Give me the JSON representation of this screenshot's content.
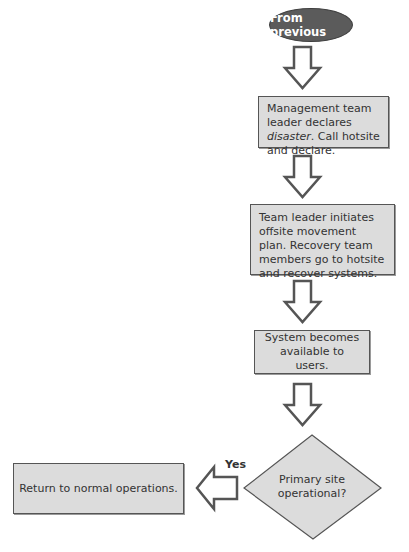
{
  "diagram": {
    "start": {
      "label": "From previous"
    },
    "steps": [
      {
        "id": "box1",
        "text_before": "Management team leader declares ",
        "emphasis": "disaster",
        "text_after": ". Call hotsite and declare."
      },
      {
        "id": "box2",
        "text": "Team leader initiates offsite movement plan. Recovery team members go to hotsite and recover systems."
      },
      {
        "id": "box3",
        "text": "System becomes available to users."
      }
    ],
    "decision": {
      "text": "Primary site operational?",
      "yes_label": "Yes"
    },
    "outcome_yes": {
      "text": "Return to normal operations."
    },
    "arrows": [
      {
        "from": "start",
        "to": "box1",
        "direction": "down"
      },
      {
        "from": "box1",
        "to": "box2",
        "direction": "down"
      },
      {
        "from": "box2",
        "to": "box3",
        "direction": "down"
      },
      {
        "from": "box3",
        "to": "decision",
        "direction": "down"
      },
      {
        "from": "decision",
        "to": "outcome_yes",
        "direction": "left",
        "label": "Yes"
      }
    ],
    "colors": {
      "start_fill": "#5b5b5b",
      "start_text": "#ffffff",
      "box_fill": "#dcdcdc",
      "box_border": "#555555",
      "arrow_stroke": "#555555",
      "arrow_fill": "#ffffff",
      "text": "#333333"
    }
  }
}
